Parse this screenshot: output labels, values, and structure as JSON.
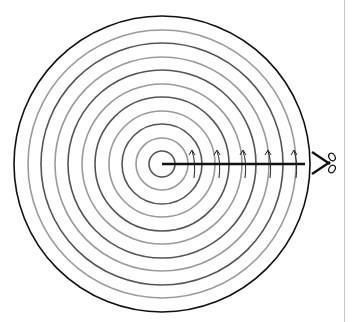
{
  "diagram": {
    "center": [
      162,
      164
    ],
    "rings": [
      {
        "r": 148,
        "color": "#111111",
        "width": 1.6
      },
      {
        "r": 134,
        "color": "#9a9a9a",
        "width": 1.6
      },
      {
        "r": 121,
        "color": "#555555",
        "width": 1.6
      },
      {
        "r": 107,
        "color": "#9a9a9a",
        "width": 1.6
      },
      {
        "r": 94,
        "color": "#555555",
        "width": 1.6
      },
      {
        "r": 80,
        "color": "#9a9a9a",
        "width": 1.6
      },
      {
        "r": 67,
        "color": "#555555",
        "width": 1.6
      },
      {
        "r": 53,
        "color": "#9a9a9a",
        "width": 1.6
      },
      {
        "r": 40,
        "color": "#555555",
        "width": 1.6
      },
      {
        "r": 26,
        "color": "#9a9a9a",
        "width": 1.6
      },
      {
        "r": 13,
        "color": "#555555",
        "width": 1.6
      }
    ],
    "cut_line": {
      "x1": 162,
      "y1": 164,
      "x2": 305,
      "y2": 164,
      "color": "#111111",
      "width": 2.5
    },
    "arrows_x": [
      193,
      218,
      244,
      269,
      295
    ],
    "arrow_color": "#222222",
    "scissors_icon": {
      "x": 312,
      "y": 152,
      "color": "#111111"
    },
    "border_color": "#c8c8c8"
  }
}
